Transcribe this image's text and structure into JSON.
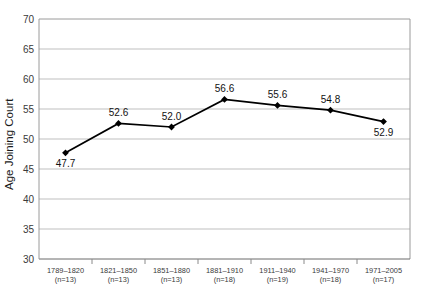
{
  "chart_data": {
    "type": "line",
    "title": "",
    "xlabel": "",
    "ylabel": "Age Joining Court",
    "ylim": [
      30,
      70
    ],
    "ytick_step": 5,
    "yticks": [
      "70",
      "65",
      "60",
      "55",
      "50",
      "45",
      "40",
      "35",
      "30"
    ],
    "grid": "horizontal",
    "legend": "none",
    "marker": "diamond",
    "line_color": "#000000",
    "marker_color": "#000000",
    "grid_color": "#bfbfbf",
    "categories": [
      "1789–1820",
      "1821–1850",
      "1851–1880",
      "1881–1910",
      "1911–1940",
      "1941–1970",
      "1971–2005"
    ],
    "category_counts": [
      "(n=13)",
      "(n=13)",
      "(n=13)",
      "(n=18)",
      "(n=19)",
      "(n=18)",
      "(n=17)"
    ],
    "values": [
      47.7,
      52.6,
      52.0,
      56.6,
      55.6,
      54.8,
      52.9
    ],
    "value_labels": [
      "47.7",
      "52.6",
      "52.0",
      "56.6",
      "55.6",
      "54.8",
      "52.9"
    ],
    "value_label_position": [
      "below",
      "above",
      "above",
      "above",
      "above",
      "above",
      "below"
    ]
  }
}
